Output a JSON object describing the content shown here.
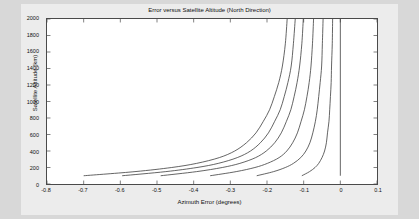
{
  "figure": {
    "bg_color": "#ececec",
    "plot_bg_color": "#ffffff",
    "axis_color": "#4a4a4a",
    "line_color": "#3c3c3c",
    "page_bg_color": "#d8d8d8"
  },
  "chart_data": {
    "type": "line",
    "title": "Error versus Satellite Altitude (North Direction)",
    "xlabel": "Azimuth Error (degrees)",
    "ylabel": "Satellite Altitude (km)",
    "xlim": [
      -0.8,
      0.1
    ],
    "ylim": [
      0,
      2000
    ],
    "xticks": [
      "-0.8",
      "-0.7",
      "-0.6",
      "-0.5",
      "-0.4",
      "-0.3",
      "-0.2",
      "-0.1",
      "0",
      "0.1"
    ],
    "xtick_values": [
      -0.8,
      -0.7,
      -0.6,
      -0.5,
      -0.4,
      -0.3,
      -0.2,
      -0.1,
      0,
      0.1
    ],
    "yticks": [
      "0",
      "200",
      "400",
      "600",
      "800",
      "1000",
      "1200",
      "1400",
      "1600",
      "1800",
      "2000"
    ],
    "ytick_values": [
      0,
      200,
      400,
      600,
      800,
      1000,
      1200,
      1400,
      1600,
      1800,
      2000
    ],
    "grid": false,
    "legend": "none",
    "series": [
      {
        "name": "curve-1",
        "x": [
          -0.7,
          -0.56,
          -0.46,
          -0.392,
          -0.33,
          -0.288,
          -0.256,
          -0.23,
          -0.21,
          -0.193,
          -0.18,
          -0.168,
          -0.158,
          -0.15,
          -0.145
        ],
        "y": [
          100,
          150,
          200,
          250,
          320,
          400,
          500,
          620,
          760,
          900,
          1060,
          1230,
          1430,
          1700,
          2000
        ]
      },
      {
        "name": "curve-2",
        "x": [
          -0.595,
          -0.476,
          -0.391,
          -0.333,
          -0.281,
          -0.245,
          -0.218,
          -0.196,
          -0.179,
          -0.164,
          -0.153,
          -0.143,
          -0.134,
          -0.128,
          -0.123
        ],
        "y": [
          100,
          150,
          200,
          250,
          320,
          400,
          500,
          620,
          760,
          900,
          1060,
          1230,
          1430,
          1700,
          2000
        ]
      },
      {
        "name": "curve-3",
        "x": [
          -0.49,
          -0.392,
          -0.322,
          -0.274,
          -0.231,
          -0.202,
          -0.179,
          -0.161,
          -0.147,
          -0.135,
          -0.126,
          -0.118,
          -0.111,
          -0.105,
          -0.101
        ],
        "y": [
          100,
          150,
          200,
          250,
          320,
          400,
          500,
          620,
          760,
          900,
          1060,
          1230,
          1430,
          1700,
          2000
        ]
      },
      {
        "name": "curve-4",
        "x": [
          -0.355,
          -0.284,
          -0.233,
          -0.199,
          -0.167,
          -0.146,
          -0.13,
          -0.117,
          -0.107,
          -0.098,
          -0.091,
          -0.085,
          -0.08,
          -0.076,
          -0.073
        ],
        "y": [
          100,
          150,
          200,
          250,
          320,
          400,
          500,
          620,
          760,
          900,
          1060,
          1230,
          1430,
          1700,
          2000
        ]
      },
      {
        "name": "curve-5",
        "x": [
          -0.228,
          -0.182,
          -0.15,
          -0.128,
          -0.108,
          -0.094,
          -0.083,
          -0.075,
          -0.068,
          -0.063,
          -0.059,
          -0.055,
          -0.051,
          -0.049,
          -0.047
        ],
        "y": [
          100,
          150,
          200,
          250,
          320,
          400,
          500,
          620,
          760,
          900,
          1060,
          1230,
          1430,
          1700,
          2000
        ]
      },
      {
        "name": "curve-6",
        "x": [
          -0.105,
          -0.084,
          -0.069,
          -0.059,
          -0.05,
          -0.043,
          -0.038,
          -0.035,
          -0.031,
          -0.029,
          -0.027,
          -0.025,
          -0.024,
          -0.022,
          -0.021
        ],
        "y": [
          100,
          150,
          200,
          250,
          320,
          400,
          500,
          620,
          760,
          900,
          1060,
          1230,
          1430,
          1700,
          2000
        ]
      },
      {
        "name": "asymptote-zero",
        "x": [
          0,
          0
        ],
        "y": [
          100,
          2000
        ]
      }
    ]
  }
}
